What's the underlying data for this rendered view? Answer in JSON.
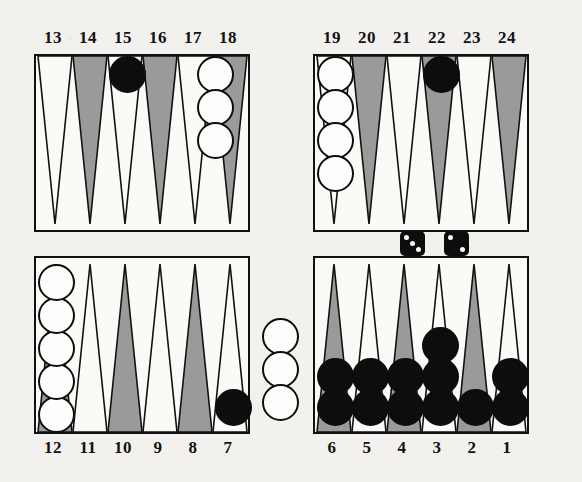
{
  "app": {
    "title": "Backgammon Board Position",
    "board_label": "backgammon-board"
  },
  "colors": {
    "board_background": "#fbfaf7",
    "page_background": "#f2f1ee",
    "point_light": "#fbfaf7",
    "point_dark": "#9a9a9a",
    "point_outline": "#111111",
    "checker_white_fill": "#fdfdfb",
    "checker_white_outline": "#0e0e0e",
    "checker_black_fill": "#0d0d0d",
    "die_body": "#0d0d0d",
    "die_pip": "#fbfaf7"
  },
  "point_labels": {
    "top_left": [
      "13",
      "14",
      "15",
      "16",
      "17",
      "18"
    ],
    "top_right": [
      "19",
      "20",
      "21",
      "22",
      "23",
      "24"
    ],
    "bottom_left": [
      "12",
      "11",
      "10",
      "9",
      "8",
      "7"
    ],
    "bottom_right": [
      "6",
      "5",
      "4",
      "3",
      "2",
      "1"
    ]
  },
  "board_state": {
    "points": [
      {
        "point": "1",
        "checkers": 2,
        "color": "black"
      },
      {
        "point": "2",
        "checkers": 1,
        "color": "black"
      },
      {
        "point": "3",
        "checkers": 3,
        "color": "black"
      },
      {
        "point": "4",
        "checkers": 2,
        "color": "black"
      },
      {
        "point": "5",
        "checkers": 2,
        "color": "black"
      },
      {
        "point": "6",
        "checkers": 2,
        "color": "black"
      },
      {
        "point": "7",
        "checkers": 1,
        "color": "black"
      },
      {
        "point": "8",
        "checkers": 0,
        "color": "none"
      },
      {
        "point": "9",
        "checkers": 0,
        "color": "none"
      },
      {
        "point": "10",
        "checkers": 0,
        "color": "none"
      },
      {
        "point": "11",
        "checkers": 0,
        "color": "none"
      },
      {
        "point": "12",
        "checkers": 5,
        "color": "white"
      },
      {
        "point": "13",
        "checkers": 0,
        "color": "none"
      },
      {
        "point": "14",
        "checkers": 0,
        "color": "none"
      },
      {
        "point": "15",
        "checkers": 1,
        "color": "black"
      },
      {
        "point": "16",
        "checkers": 0,
        "color": "none"
      },
      {
        "point": "17",
        "checkers": 3,
        "color": "white"
      },
      {
        "point": "18",
        "checkers": 0,
        "color": "none"
      },
      {
        "point": "19",
        "checkers": 4,
        "color": "white"
      },
      {
        "point": "20",
        "checkers": 0,
        "color": "none"
      },
      {
        "point": "21",
        "checkers": 0,
        "color": "none"
      },
      {
        "point": "22",
        "checkers": 1,
        "color": "black"
      },
      {
        "point": "23",
        "checkers": 0,
        "color": "none"
      },
      {
        "point": "24",
        "checkers": 0,
        "color": "none"
      }
    ],
    "bar": {
      "white_checkers": 3,
      "black_checkers": 0
    },
    "totals": {
      "white_on_board": 12,
      "black_on_board": 13
    }
  },
  "dice": {
    "roll_label": "dice-roll",
    "values": [
      3,
      2
    ],
    "die_one": 3,
    "die_two": 2
  }
}
